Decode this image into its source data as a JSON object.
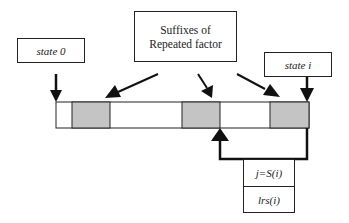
{
  "diagram": {
    "labels": {
      "state_0": "state 0",
      "suffixes": "Suffixes of\nRepeated factor",
      "suffixes_line1": "Suffixes of",
      "suffixes_line2": "Repeated factor",
      "state_i": "state i",
      "j_eq_s_i": "j=S(i)",
      "lrs_i": "lrs(i)"
    },
    "bar": {
      "segments": [
        {
          "type": "white"
        },
        {
          "type": "gray"
        },
        {
          "type": "white"
        },
        {
          "type": "gray"
        },
        {
          "type": "white"
        },
        {
          "type": "gray"
        }
      ]
    },
    "colors": {
      "stroke": "#222222",
      "gray_fill": "#c4c4c4",
      "background": "#ffffff"
    }
  }
}
